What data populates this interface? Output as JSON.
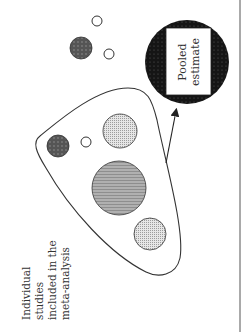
{
  "diagram": {
    "studies_label_lines": [
      "Individual",
      "studies",
      "included in the",
      "meta-analysis"
    ],
    "pooled_label_lines": [
      "Pooled",
      "estimate"
    ],
    "colors": {
      "outline": "#333333",
      "dark_dot_fill": "#555555",
      "light_dot_fill": "#cfcfcf",
      "large_fill": "#a9a9a9",
      "pooled_fill": "#151515",
      "background": "#ffffff"
    },
    "included_studies": [
      {
        "id": "s1",
        "style": "dark-dotted",
        "cx": 58,
        "cy": 146,
        "r": 11
      },
      {
        "id": "s2",
        "style": "open",
        "cx": 86,
        "cy": 142,
        "r": 5
      },
      {
        "id": "s3",
        "style": "light-dotted",
        "cx": 120,
        "cy": 131,
        "r": 17
      },
      {
        "id": "s4",
        "style": "large-gray",
        "cx": 119,
        "cy": 188,
        "r": 27
      },
      {
        "id": "s5",
        "style": "light-dotted",
        "cx": 150,
        "cy": 234,
        "r": 16
      }
    ],
    "excluded_studies": [
      {
        "id": "e1",
        "style": "dark-dotted",
        "cx": 81,
        "cy": 48,
        "r": 11
      },
      {
        "id": "e2",
        "style": "open",
        "cx": 97,
        "cy": 21,
        "r": 5
      },
      {
        "id": "e3",
        "style": "open",
        "cx": 109,
        "cy": 54,
        "r": 5
      }
    ],
    "pooled": {
      "cx": 187,
      "cy": 62,
      "r": 42
    }
  }
}
